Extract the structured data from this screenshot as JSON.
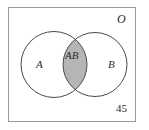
{
  "figure": {
    "type": "venn-diagram",
    "width": 149,
    "height": 130,
    "universe": {
      "label": "O",
      "border_color": "#9a9a9a",
      "fill_color": "#ffffff"
    },
    "sets": [
      {
        "id": "A",
        "label": "A",
        "stroke_color": "#4a4a4a",
        "fill_color": "#ffffff"
      },
      {
        "id": "B",
        "label": "B",
        "stroke_color": "#4a4a4a",
        "fill_color": "#ffffff"
      }
    ],
    "intersection": {
      "label": "AB",
      "fill_color": "#b5b5b5",
      "inner_mark": "+"
    },
    "outside_region": {
      "value": "45"
    }
  }
}
